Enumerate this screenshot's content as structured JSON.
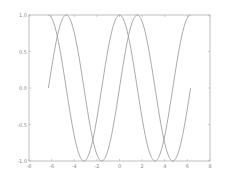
{
  "chart_data": {
    "type": "line",
    "title": "",
    "xlabel": "",
    "ylabel": "",
    "xlim": [
      -8,
      8
    ],
    "ylim": [
      -1.0,
      1.0
    ],
    "grid": false,
    "legend": null,
    "xticks": [
      "-8",
      "-6",
      "-4",
      "-2",
      "0",
      "2",
      "4",
      "6",
      "8"
    ],
    "yticks": [
      "-1.0",
      "-0.5",
      "0.0",
      "0.5",
      "1.0"
    ],
    "series": [
      {
        "name": "sin(x)",
        "function": "sin",
        "x_range": [
          -6.283,
          6.283
        ],
        "color": "#a0a0a0",
        "sample_points": [
          [
            -6.283,
            0.0
          ],
          [
            -4.712,
            1.0
          ],
          [
            -3.142,
            0.0
          ],
          [
            -1.571,
            -1.0
          ],
          [
            0.0,
            0.0
          ],
          [
            1.571,
            1.0
          ],
          [
            3.142,
            0.0
          ],
          [
            4.712,
            -1.0
          ],
          [
            6.283,
            0.0
          ]
        ]
      },
      {
        "name": "cos(x)",
        "function": "cos",
        "x_range": [
          -6.283,
          6.283
        ],
        "color": "#a0a0a0",
        "sample_points": [
          [
            -6.283,
            1.0
          ],
          [
            -4.712,
            0.0
          ],
          [
            -3.142,
            -1.0
          ],
          [
            -1.571,
            0.0
          ],
          [
            0.0,
            1.0
          ],
          [
            1.571,
            0.0
          ],
          [
            3.142,
            -1.0
          ],
          [
            4.712,
            0.0
          ],
          [
            6.283,
            1.0
          ]
        ]
      }
    ]
  },
  "axes": {
    "frame_color": "#b0b0b0",
    "tick_color": "#8a8a8a"
  }
}
